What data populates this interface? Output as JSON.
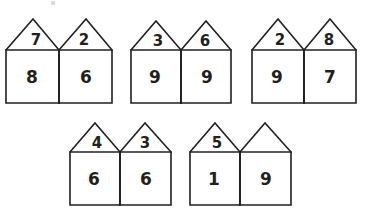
{
  "worksheet": {
    "title": "Number Houses",
    "description": "Pairs of adjoining houses; each roof and each house body contains a single digit. One roof is left blank to be filled in.",
    "background_color": "#ffffff",
    "ink_color": "#231f20",
    "rows": [
      {
        "row_name": "top-row",
        "groups": [
          {
            "group_name": "house-pair-1",
            "left": {
              "roof": "7",
              "body": "8"
            },
            "right": {
              "roof": "2",
              "body": "6"
            }
          },
          {
            "group_name": "house-pair-2",
            "left": {
              "roof": "3",
              "body": "9"
            },
            "right": {
              "roof": "6",
              "body": "9"
            }
          },
          {
            "group_name": "house-pair-3",
            "left": {
              "roof": "2",
              "body": "9"
            },
            "right": {
              "roof": "8",
              "body": "7"
            }
          }
        ]
      },
      {
        "row_name": "bottom-row",
        "groups": [
          {
            "group_name": "house-pair-4",
            "left": {
              "roof": "4",
              "body": "6"
            },
            "right": {
              "roof": "3",
              "body": "6"
            }
          },
          {
            "group_name": "house-pair-5",
            "left": {
              "roof": "5",
              "body": "1"
            },
            "right": {
              "roof": "",
              "body": "9"
            }
          }
        ]
      }
    ]
  }
}
